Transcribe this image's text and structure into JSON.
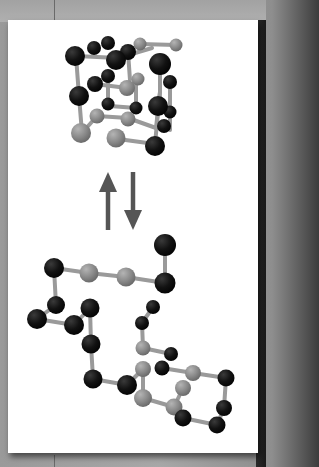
{
  "figure": {
    "colors": {
      "background": "#a0a0a0",
      "card": "#ffffff",
      "dark_atom": "#111111",
      "light_atom": "#8a8a8a",
      "bond": "#9a9a9a",
      "arrow": "#555555"
    },
    "top_structure": {
      "label": "cubic cage cluster",
      "atom_counts": {
        "dark": 20,
        "light": 9
      }
    },
    "equilibrium_arrows": {
      "forward": "up-arrow",
      "reverse": "down-arrow"
    },
    "bottom_structure": {
      "label": "open chain cluster",
      "atom_counts": {
        "dark": 17,
        "light": 9
      }
    }
  }
}
